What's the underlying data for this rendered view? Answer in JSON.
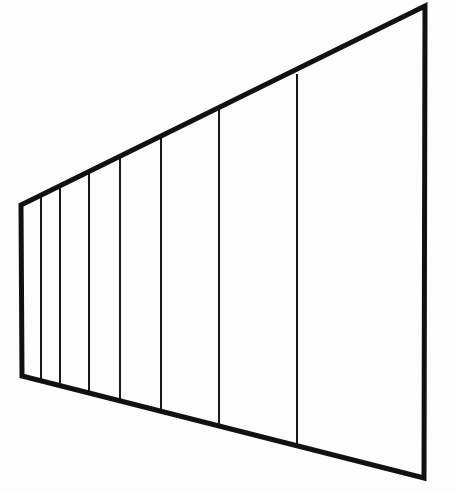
{
  "figure": {
    "caption": "",
    "background_color": "#fdfdfd",
    "stroke_color": "#111111",
    "divider_color": "#1a1a1a",
    "canvas": {
      "width": 456,
      "height": 493
    }
  },
  "chart_data": {
    "type": "line",
    "subtitle": "",
    "xlabel": "",
    "ylabel": "",
    "xlim": [
      0,
      456
    ],
    "ylim": [
      0,
      493
    ],
    "grid": false,
    "legend": "none",
    "annotations": [],
    "outer_outline": {
      "name": "wall-outline",
      "closed": true,
      "stroke_width": 5,
      "points": [
        [
          21,
          205
        ],
        [
          425,
          6
        ],
        [
          424,
          478
        ],
        [
          22,
          376
        ]
      ]
    },
    "vertical_dividers": {
      "name": "fence-post-lines",
      "stroke_width": 2,
      "count": 7,
      "lines": [
        {
          "id": "divider-1",
          "x": 41,
          "y_top": 196,
          "y_bottom": 381
        },
        {
          "id": "divider-2",
          "x": 60,
          "y_top": 187,
          "y_bottom": 386
        },
        {
          "id": "divider-3",
          "x": 89,
          "y_top": 172,
          "y_bottom": 393
        },
        {
          "id": "divider-4",
          "x": 120,
          "y_top": 157,
          "y_bottom": 401
        },
        {
          "id": "divider-5",
          "x": 161,
          "y_top": 137,
          "y_bottom": 412
        },
        {
          "id": "divider-6",
          "x": 219,
          "y_top": 110,
          "y_bottom": 426
        },
        {
          "id": "divider-7",
          "x": 297,
          "y_top": 74,
          "y_bottom": 446
        }
      ]
    },
    "edges": [
      {
        "id": "left-edge",
        "label": "near vertical edge",
        "from": [
          21,
          205
        ],
        "to": [
          22,
          376
        ]
      },
      {
        "id": "top-edge",
        "label": "upper rail",
        "from": [
          21,
          205
        ],
        "to": [
          425,
          6
        ]
      },
      {
        "id": "right-edge",
        "label": "far vertical edge",
        "from": [
          425,
          6
        ],
        "to": [
          424,
          478
        ]
      },
      {
        "id": "bottom-edge",
        "label": "lower rail",
        "from": [
          22,
          376
        ],
        "to": [
          424,
          478
        ]
      }
    ],
    "panels": [
      {
        "id": "panel-1",
        "left_x": 21,
        "right_x": 41
      },
      {
        "id": "panel-2",
        "left_x": 41,
        "right_x": 60
      },
      {
        "id": "panel-3",
        "left_x": 60,
        "right_x": 89
      },
      {
        "id": "panel-4",
        "left_x": 89,
        "right_x": 120
      },
      {
        "id": "panel-5",
        "left_x": 120,
        "right_x": 161
      },
      {
        "id": "panel-6",
        "left_x": 161,
        "right_x": 219
      },
      {
        "id": "panel-7",
        "left_x": 219,
        "right_x": 297
      },
      {
        "id": "panel-8",
        "left_x": 297,
        "right_x": 424
      }
    ]
  }
}
